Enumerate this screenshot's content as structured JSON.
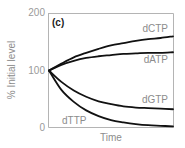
{
  "chart_data": {
    "type": "line",
    "panel_label": "(c)",
    "title": "",
    "xlabel": "Time",
    "ylabel": "% Initial level",
    "ylim": [
      0,
      200
    ],
    "yticks": [
      0,
      100,
      200
    ],
    "ytick_labels": [
      "0",
      "100",
      "200"
    ],
    "xticks": [],
    "grid": false,
    "legend": "inline labels",
    "x": [
      0,
      0.1,
      0.2,
      0.3,
      0.4,
      0.5,
      0.6,
      0.7,
      0.8,
      0.9,
      1.0
    ],
    "series": [
      {
        "name": "dCTP",
        "values": [
          100,
          112,
          123,
          131,
          138,
          144,
          148,
          152,
          155,
          157,
          160
        ]
      },
      {
        "name": "dATP",
        "values": [
          100,
          110,
          117,
          122,
          125,
          127,
          129,
          130,
          131,
          131,
          132
        ]
      },
      {
        "name": "dGTP",
        "values": [
          100,
          80,
          65,
          54,
          46,
          41,
          37,
          35,
          34,
          33,
          32
        ]
      },
      {
        "name": "dTTP",
        "values": [
          100,
          66,
          45,
          30,
          20,
          13,
          9,
          6,
          4,
          3,
          2
        ]
      }
    ]
  }
}
